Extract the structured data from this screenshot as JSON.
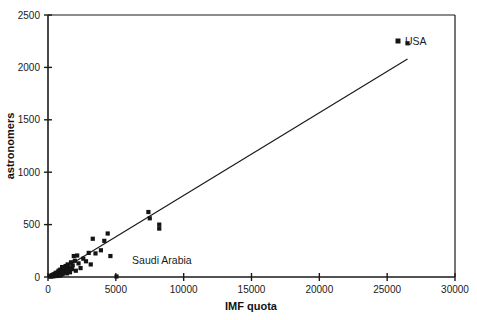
{
  "chart_data": {
    "type": "scatter",
    "title": "",
    "xlabel": "IMF quota",
    "ylabel": "astronomers",
    "xlim": [
      0,
      30000
    ],
    "ylim": [
      0,
      2500
    ],
    "xticks": [
      0,
      5000,
      10000,
      15000,
      20000,
      25000,
      30000
    ],
    "yticks": [
      0,
      500,
      1000,
      1500,
      2000,
      2500
    ],
    "xtick_labels": [
      "0",
      "5000",
      "10000",
      "15000",
      "20000",
      "25000",
      "30000"
    ],
    "ytick_labels": [
      "0",
      "500",
      "1000",
      "1500",
      "2000",
      "2500"
    ],
    "grid": false,
    "legend": {
      "position": "top-right",
      "entries": [
        {
          "label": "USA",
          "marker": "square",
          "color": "#141414"
        }
      ]
    },
    "annotations": [
      {
        "text": "Saudi Arabia",
        "x": 6200,
        "y": 120,
        "anchor": "start"
      },
      {
        "text": "USA",
        "x": 27200,
        "y": 2230,
        "anchor": "start"
      }
    ],
    "series": [
      {
        "name": "countries",
        "marker": "square",
        "color": "#141414",
        "points": [
          [
            150,
            5
          ],
          [
            200,
            8
          ],
          [
            230,
            12
          ],
          [
            260,
            6
          ],
          [
            300,
            15
          ],
          [
            330,
            10
          ],
          [
            360,
            20
          ],
          [
            390,
            8
          ],
          [
            420,
            25
          ],
          [
            450,
            14
          ],
          [
            470,
            9
          ],
          [
            500,
            30
          ],
          [
            520,
            18
          ],
          [
            550,
            12
          ],
          [
            580,
            40
          ],
          [
            600,
            22
          ],
          [
            630,
            10
          ],
          [
            650,
            35
          ],
          [
            680,
            16
          ],
          [
            700,
            28
          ],
          [
            720,
            45
          ],
          [
            750,
            20
          ],
          [
            780,
            60
          ],
          [
            800,
            33
          ],
          [
            820,
            12
          ],
          [
            850,
            48
          ],
          [
            880,
            25
          ],
          [
            900,
            70
          ],
          [
            930,
            38
          ],
          [
            960,
            18
          ],
          [
            1000,
            55
          ],
          [
            1040,
            95
          ],
          [
            1080,
            30
          ],
          [
            1120,
            62
          ],
          [
            1160,
            42
          ],
          [
            1200,
            80
          ],
          [
            1250,
            50
          ],
          [
            1300,
            105
          ],
          [
            1350,
            68
          ],
          [
            1400,
            35
          ],
          [
            1450,
            120
          ],
          [
            1500,
            60
          ],
          [
            1560,
            90
          ],
          [
            1620,
            45
          ],
          [
            1700,
            140
          ],
          [
            1760,
            75
          ],
          [
            1820,
            110
          ],
          [
            1900,
            200
          ],
          [
            1980,
            155
          ],
          [
            2050,
            60
          ],
          [
            2150,
            205
          ],
          [
            2250,
            130
          ],
          [
            2400,
            85
          ],
          [
            2600,
            175
          ],
          [
            2800,
            150
          ],
          [
            3000,
            230
          ],
          [
            3150,
            120
          ],
          [
            3300,
            365
          ],
          [
            3500,
            225
          ],
          [
            3900,
            255
          ],
          [
            4150,
            345
          ],
          [
            4400,
            415
          ],
          [
            4600,
            200
          ],
          [
            5050,
            5
          ],
          [
            7400,
            620
          ],
          [
            7500,
            560
          ],
          [
            8200,
            500
          ],
          [
            8200,
            462
          ],
          [
            26500,
            2230
          ]
        ]
      }
    ],
    "fit_line": {
      "name": "linear fit",
      "x": [
        200,
        26500
      ],
      "y": [
        5,
        2080
      ],
      "color": "#1a1a1a"
    }
  },
  "axes": {
    "x_title": "IMF quota",
    "y_title": "astronomers"
  }
}
